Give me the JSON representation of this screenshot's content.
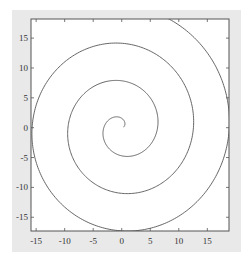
{
  "chart_data": {
    "type": "line",
    "title": "",
    "xlabel": "",
    "ylabel": "",
    "equation": "x = t*cos(t), y = t*sin(t)",
    "t_range": [
      0.3,
      20.6
    ],
    "xlim": [
      -15.9,
      18.8
    ],
    "ylim": [
      -17.3,
      18.2
    ],
    "xticks": [
      -15,
      -10,
      -5,
      0,
      5,
      10,
      15
    ],
    "yticks": [
      -15,
      -10,
      -5,
      0,
      5,
      10,
      15
    ],
    "xtick_labels": [
      "-15",
      "-10",
      "-5",
      "0",
      "5",
      "10",
      "15"
    ],
    "ytick_labels": [
      "-15",
      "-10",
      "-5",
      "0",
      "5",
      "10",
      "15"
    ],
    "grid": false,
    "legend": null,
    "series": [
      {
        "name": "spiral",
        "color": "#555555",
        "sample_points": [
          [
            0,
            0
          ],
          [
            3.14,
            0
          ],
          [
            0,
            -4.71
          ],
          [
            -6.28,
            0
          ],
          [
            0,
            7.85
          ],
          [
            9.42,
            0
          ],
          [
            0,
            -10.99
          ],
          [
            -12.57,
            0
          ],
          [
            0,
            14.14
          ],
          [
            15.71,
            0
          ],
          [
            0,
            -17.28
          ],
          [
            -18.85,
            0
          ]
        ]
      }
    ]
  },
  "colors": {
    "figure_bg": "#e9e9e9",
    "axes_bg": "#ffffff",
    "axes_edge": "#555555",
    "line": "#555555"
  }
}
